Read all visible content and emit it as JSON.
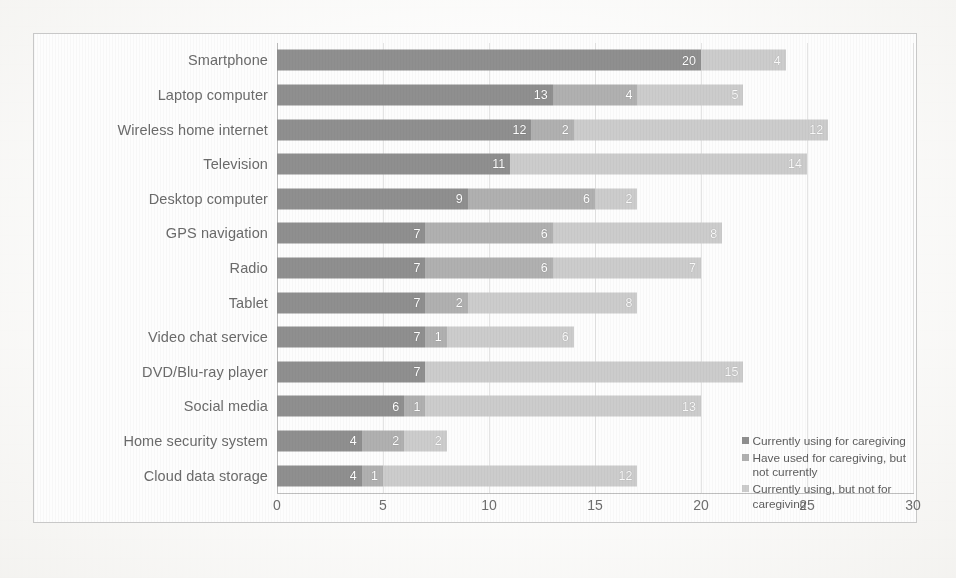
{
  "chart_data": {
    "type": "bar",
    "orientation": "horizontal",
    "stacked": true,
    "title": "",
    "xlabel": "",
    "ylabel": "",
    "xlim": [
      0,
      30
    ],
    "xticks": [
      0,
      5,
      10,
      15,
      20,
      25,
      30
    ],
    "grid": true,
    "legend_position": "bottom-right",
    "categories": [
      "Smartphone",
      "Laptop computer",
      "Wireless home internet",
      "Television",
      "Desktop computer",
      "GPS navigation",
      "Radio",
      "Tablet",
      "Video chat service",
      "DVD/Blu-ray player",
      "Social media",
      "Home security system",
      "Cloud data storage"
    ],
    "series": [
      {
        "name": "Currently using for caregiving",
        "color": "#8f8f8f",
        "values": [
          20,
          13,
          12,
          11,
          9,
          7,
          7,
          7,
          7,
          7,
          6,
          4,
          4
        ]
      },
      {
        "name": "Have used for caregiving, but not currently",
        "color": "#b0b0b0",
        "values": [
          0,
          4,
          2,
          0,
          6,
          6,
          6,
          2,
          1,
          0,
          1,
          2,
          1
        ]
      },
      {
        "name": "Currently using, but not for caregiving",
        "color": "#cccccc",
        "values": [
          4,
          5,
          12,
          14,
          2,
          8,
          7,
          8,
          6,
          15,
          13,
          2,
          12
        ]
      }
    ]
  },
  "legend": {
    "items": [
      "Currently using for caregiving",
      "Have used for caregiving, but not currently",
      "Currently using, but not for caregiving"
    ]
  },
  "caption": ""
}
